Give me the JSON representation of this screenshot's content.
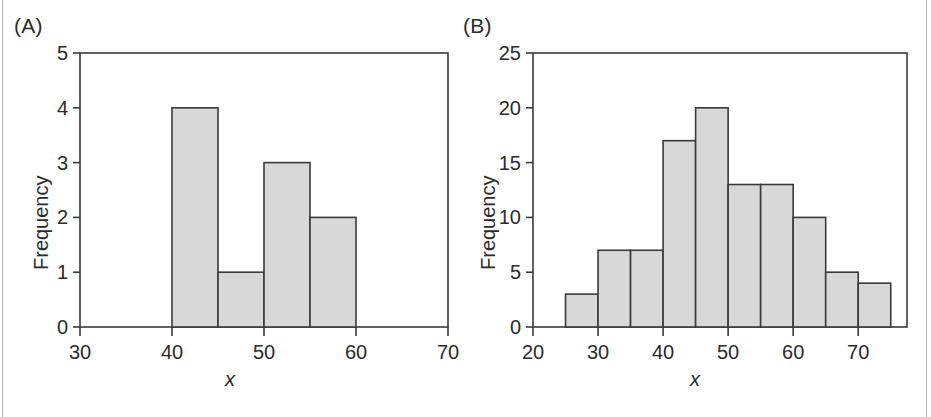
{
  "figure": {
    "width": 931,
    "height": 417,
    "background": "#ffffff",
    "edge_rule_color": "#b9b9b9",
    "axis_color": "#3a3a3a",
    "bar_fill": "#d8d8d8",
    "bar_stroke": "#3a3a3a",
    "text_color": "#2b2b2b"
  },
  "panels": [
    {
      "id": "A",
      "label": "(A)",
      "xlabel": "x",
      "ylabel": "Frequency",
      "xticks": [
        30,
        40,
        50,
        60,
        70
      ],
      "xticklabels": [
        "30",
        "40",
        "50",
        "60",
        "70"
      ],
      "yticks": [
        0,
        1,
        2,
        3,
        4,
        5
      ],
      "yticklabels": [
        "0",
        "1",
        "2",
        "3",
        "4",
        "5"
      ],
      "xlim": [
        30,
        70
      ],
      "ylim": [
        0,
        5
      ]
    },
    {
      "id": "B",
      "label": "(B)",
      "xlabel": "x",
      "ylabel": "Frequency",
      "xticks": [
        20,
        30,
        40,
        50,
        60,
        70
      ],
      "xticklabels": [
        "20",
        "30",
        "40",
        "50",
        "60",
        "70"
      ],
      "yticks": [
        0,
        5,
        10,
        15,
        20,
        25
      ],
      "yticklabels": [
        "0",
        "5",
        "10",
        "15",
        "20",
        "25"
      ],
      "xlim": [
        20,
        77.5
      ],
      "ylim": [
        0,
        25
      ]
    }
  ],
  "chart_data": [
    {
      "type": "bar",
      "title": "(A)",
      "xlabel": "x",
      "ylabel": "Frequency",
      "xlim": [
        30,
        70
      ],
      "ylim": [
        0,
        5
      ],
      "grid": false,
      "legend": "none",
      "bin_width": 5,
      "bin_edges": [
        40,
        45,
        50,
        55,
        60
      ],
      "categories": [
        "40-45",
        "45-50",
        "50-55",
        "55-60"
      ],
      "values": [
        4,
        1,
        3,
        2
      ],
      "xticklabels": [
        "30",
        "40",
        "50",
        "60",
        "70"
      ],
      "yticklabels": [
        "0",
        "1",
        "2",
        "3",
        "4",
        "5"
      ]
    },
    {
      "type": "bar",
      "title": "(B)",
      "xlabel": "x",
      "ylabel": "Frequency",
      "xlim": [
        20,
        77.5
      ],
      "ylim": [
        0,
        25
      ],
      "grid": false,
      "legend": "none",
      "bin_width": 5,
      "bin_edges": [
        25,
        30,
        35,
        40,
        45,
        50,
        55,
        60,
        65,
        70,
        75
      ],
      "categories": [
        "25-30",
        "30-35",
        "35-40",
        "40-45",
        "45-50",
        "50-55",
        "55-60",
        "60-65",
        "65-70",
        "70-75"
      ],
      "values": [
        3,
        7,
        7,
        17,
        20,
        13,
        13,
        10,
        5,
        4
      ],
      "xticklabels": [
        "20",
        "30",
        "40",
        "50",
        "60",
        "70"
      ],
      "yticklabels": [
        "0",
        "5",
        "10",
        "15",
        "20",
        "25"
      ]
    }
  ]
}
